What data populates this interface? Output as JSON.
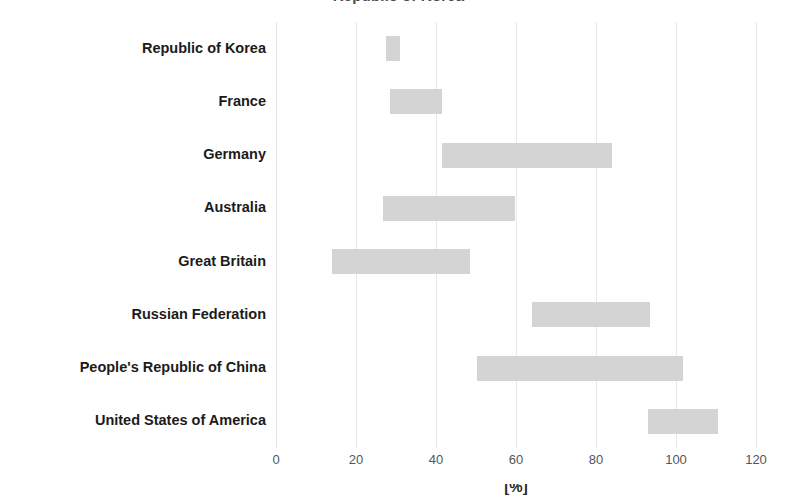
{
  "chart_data": {
    "type": "bar",
    "bar_style": "floating-range-horizontal",
    "orientation": "horizontal",
    "title": "Republic of Korea",
    "xlabel": "[%]",
    "ylabel": "",
    "xlim": [
      0,
      120
    ],
    "ylim": null,
    "grid": true,
    "grid_axis": "x",
    "legend": false,
    "legend_position": "none",
    "bar_color": "#d4d4d4",
    "categories": [
      "Republic of Korea",
      "France",
      "Germany",
      "Australia",
      "Great Britain",
      "Russian Federation",
      "People's Republic of China",
      "United States of America"
    ],
    "ranges": [
      {
        "category": "Republic of Korea",
        "start": 27.5,
        "end": 31.0
      },
      {
        "category": "France",
        "start": 28.5,
        "end": 41.5
      },
      {
        "category": "Germany",
        "start": 41.5,
        "end": 84.0
      },
      {
        "category": "Australia",
        "start": 26.8,
        "end": 59.8
      },
      {
        "category": "Great Britain",
        "start": 14.0,
        "end": 48.5
      },
      {
        "category": "Russian Federation",
        "start": 64.0,
        "end": 93.5
      },
      {
        "category": "People's Republic of China",
        "start": 50.3,
        "end": 101.8
      },
      {
        "category": "United States of America",
        "start": 93.0,
        "end": 110.5
      }
    ],
    "xticks": [
      0,
      20,
      40,
      60,
      80,
      100,
      120
    ],
    "xtick_labels": [
      "0",
      "20",
      "40",
      "60",
      "80",
      "100",
      "120"
    ]
  }
}
